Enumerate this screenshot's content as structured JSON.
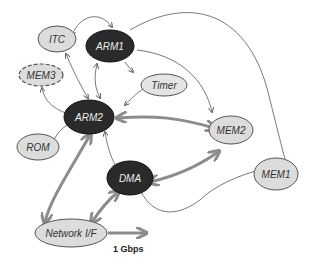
{
  "diagram": {
    "nodes": [
      {
        "id": "itc",
        "label": "ITC",
        "style": "light"
      },
      {
        "id": "arm1",
        "label": "ARM1",
        "style": "dark"
      },
      {
        "id": "mem3",
        "label": "MEM3",
        "style": "light-dashed"
      },
      {
        "id": "timer",
        "label": "Timer",
        "style": "light"
      },
      {
        "id": "arm2",
        "label": "ARM2",
        "style": "dark"
      },
      {
        "id": "mem2",
        "label": "MEM2",
        "style": "light"
      },
      {
        "id": "rom",
        "label": "ROM",
        "style": "light"
      },
      {
        "id": "dma",
        "label": "DMA",
        "style": "dark"
      },
      {
        "id": "mem1",
        "label": "MEM1",
        "style": "light"
      },
      {
        "id": "netif",
        "label": "Network I/F",
        "style": "light"
      }
    ],
    "edges": [
      {
        "from": "arm1",
        "to": "itc",
        "weight": "thin",
        "dir": "both"
      },
      {
        "from": "arm1",
        "to": "mem1",
        "weight": "thin",
        "dir": "forward"
      },
      {
        "from": "arm1",
        "to": "mem2",
        "weight": "thin",
        "dir": "forward"
      },
      {
        "from": "itc",
        "to": "arm2",
        "weight": "thin",
        "dir": "both"
      },
      {
        "from": "arm1",
        "to": "arm2",
        "weight": "thin",
        "dir": "both"
      },
      {
        "from": "mem3",
        "to": "arm2",
        "weight": "thin",
        "dir": "both"
      },
      {
        "from": "arm2",
        "to": "timer",
        "weight": "thin",
        "dir": "both"
      },
      {
        "from": "rom",
        "to": "arm2",
        "weight": "thin",
        "dir": "both"
      },
      {
        "from": "arm2",
        "to": "mem2",
        "weight": "thick",
        "dir": "both"
      },
      {
        "from": "arm2",
        "to": "dma",
        "weight": "thin",
        "dir": "both"
      },
      {
        "from": "dma",
        "to": "mem2",
        "weight": "thick",
        "dir": "both"
      },
      {
        "from": "dma",
        "to": "mem1",
        "weight": "thin",
        "dir": "forward"
      },
      {
        "from": "arm2",
        "to": "netif",
        "weight": "thick",
        "dir": "both"
      },
      {
        "from": "netif",
        "to": "dma",
        "weight": "thick",
        "dir": "both"
      }
    ],
    "output_label": "1 Gbps",
    "colors": {
      "dark_node": "#2a2a2a",
      "light_node": "#dcdcdc",
      "edge": "#6a6a6a",
      "thick_edge": "#8c8c8c"
    }
  }
}
